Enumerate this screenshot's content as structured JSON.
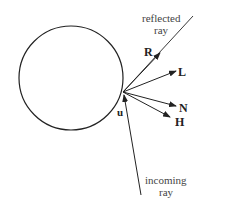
{
  "diagram": {
    "title": "",
    "labels": {
      "reflected_line1": "reflected",
      "reflected_line2": "ray",
      "incoming_line1": "incoming",
      "incoming_line2": "ray",
      "R": "R",
      "L": "L",
      "N": "N",
      "H": "H",
      "u": "u"
    },
    "colors": {
      "stroke": "#222222",
      "background": "#ffffff"
    }
  }
}
